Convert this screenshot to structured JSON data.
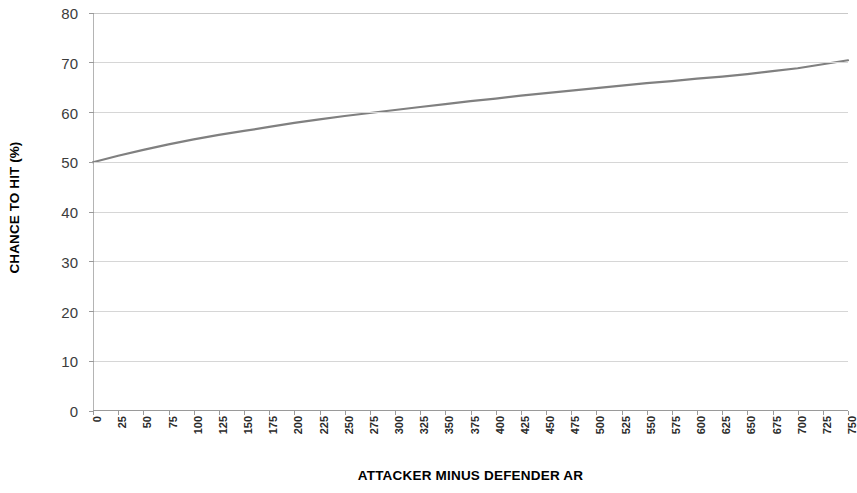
{
  "chart_data": {
    "type": "line",
    "title": "",
    "xlabel": "ATTACKER MINUS DEFENDER AR",
    "ylabel": "CHANCE TO HIT (%)",
    "xlim": [
      0,
      750
    ],
    "ylim": [
      0,
      80
    ],
    "ytick_step": 10,
    "xtick_step": 25,
    "grid": "horizontal",
    "legend": "none",
    "line_color": "#808080",
    "grid_color": "#d6d6d6",
    "axis_color": "#9a9a9a",
    "background_color": "#ffffff",
    "x_ticks": [
      0,
      25,
      50,
      75,
      100,
      125,
      150,
      175,
      200,
      225,
      250,
      275,
      300,
      325,
      350,
      375,
      400,
      425,
      450,
      475,
      500,
      525,
      550,
      575,
      600,
      625,
      650,
      675,
      700,
      725,
      750
    ],
    "y_ticks": [
      0,
      10,
      20,
      30,
      40,
      50,
      60,
      70,
      80
    ],
    "x": [
      0,
      25,
      50,
      75,
      100,
      125,
      150,
      175,
      200,
      225,
      250,
      275,
      300,
      325,
      350,
      375,
      400,
      425,
      450,
      475,
      500,
      525,
      550,
      575,
      600,
      625,
      650,
      675,
      700,
      725,
      750
    ],
    "values": [
      50.0,
      51.3,
      52.5,
      53.6,
      54.6,
      55.5,
      56.3,
      57.1,
      57.9,
      58.6,
      59.3,
      59.9,
      60.5,
      61.1,
      61.7,
      62.3,
      62.8,
      63.4,
      63.9,
      64.4,
      64.9,
      65.4,
      65.9,
      66.3,
      66.8,
      67.2,
      67.7,
      68.3,
      68.9,
      69.7,
      70.5
    ],
    "series": [
      {
        "name": "Chance to hit",
        "values": [
          50.0,
          51.3,
          52.5,
          53.6,
          54.6,
          55.5,
          56.3,
          57.1,
          57.9,
          58.6,
          59.3,
          59.9,
          60.5,
          61.1,
          61.7,
          62.3,
          62.8,
          63.4,
          63.9,
          64.4,
          64.9,
          65.4,
          65.9,
          66.3,
          66.8,
          67.2,
          67.7,
          68.3,
          68.9,
          69.7,
          70.5
        ]
      }
    ]
  }
}
